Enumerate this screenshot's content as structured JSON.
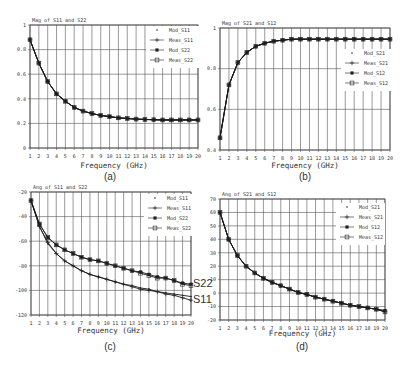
{
  "chart_data": [
    {
      "id": "a",
      "type": "line",
      "title": "Mag of S11 and S22",
      "caption": "(a)",
      "xlabel": "Frequency (GHz)",
      "ylabel": "",
      "x": [
        1,
        2,
        3,
        4,
        5,
        6,
        7,
        8,
        9,
        10,
        11,
        12,
        13,
        14,
        15,
        16,
        17,
        18,
        19,
        20
      ],
      "xlim": [
        1,
        20
      ],
      "ylim": [
        0,
        1
      ],
      "yticks": [
        "0",
        "0.2",
        "0.4",
        "0.6",
        "0.8",
        "1"
      ],
      "grid": true,
      "legend_position": "upper right",
      "legend": [
        "Mod_S11",
        "Meas_S11",
        "Mod_S22",
        "Meas_S22"
      ],
      "series": [
        {
          "name": "Mod_S11",
          "values": [
            0.88,
            0.69,
            0.54,
            0.44,
            0.38,
            0.33,
            0.3,
            0.28,
            0.265,
            0.255,
            0.245,
            0.24,
            0.235,
            0.232,
            0.23,
            0.228,
            0.228,
            0.228,
            0.228,
            0.228
          ]
        },
        {
          "name": "Meas_S11",
          "values": [
            0.88,
            0.69,
            0.54,
            0.44,
            0.38,
            0.33,
            0.3,
            0.28,
            0.265,
            0.255,
            0.245,
            0.24,
            0.235,
            0.232,
            0.23,
            0.228,
            0.228,
            0.228,
            0.228,
            0.228
          ]
        },
        {
          "name": "Mod_S22",
          "values": [
            0.88,
            0.69,
            0.54,
            0.44,
            0.38,
            0.33,
            0.3,
            0.28,
            0.265,
            0.255,
            0.245,
            0.24,
            0.235,
            0.232,
            0.23,
            0.228,
            0.228,
            0.228,
            0.228,
            0.228
          ]
        },
        {
          "name": "Meas_S22",
          "values": [
            0.88,
            0.69,
            0.54,
            0.44,
            0.38,
            0.33,
            0.3,
            0.28,
            0.265,
            0.255,
            0.245,
            0.24,
            0.235,
            0.232,
            0.23,
            0.228,
            0.228,
            0.228,
            0.228,
            0.228
          ]
        }
      ]
    },
    {
      "id": "b",
      "type": "line",
      "title": "Mag of S21 and S12",
      "caption": "(b)",
      "xlabel": "Frequency (GHz)",
      "ylabel": "",
      "x": [
        1,
        2,
        3,
        4,
        5,
        6,
        7,
        8,
        9,
        10,
        11,
        12,
        13,
        14,
        15,
        16,
        17,
        18,
        19,
        20
      ],
      "xlim": [
        1,
        20
      ],
      "ylim": [
        0.4,
        1
      ],
      "yticks": [
        "0.4",
        "0.6",
        "0.8",
        "1"
      ],
      "grid": true,
      "legend_position": "center right",
      "legend": [
        "Mod_S21",
        "Meas_S21",
        "Mod_S12",
        "Meas_S12"
      ],
      "series": [
        {
          "name": "Mod_S21",
          "values": [
            0.46,
            0.72,
            0.83,
            0.88,
            0.91,
            0.925,
            0.935,
            0.94,
            0.945,
            0.945,
            0.945,
            0.945,
            0.945,
            0.945,
            0.945,
            0.945,
            0.945,
            0.945,
            0.945,
            0.945
          ]
        },
        {
          "name": "Meas_S21",
          "values": [
            0.46,
            0.72,
            0.83,
            0.88,
            0.91,
            0.925,
            0.935,
            0.94,
            0.945,
            0.945,
            0.945,
            0.945,
            0.945,
            0.945,
            0.945,
            0.945,
            0.945,
            0.945,
            0.945,
            0.945
          ]
        },
        {
          "name": "Mod_S12",
          "values": [
            0.46,
            0.72,
            0.83,
            0.88,
            0.91,
            0.925,
            0.935,
            0.94,
            0.945,
            0.945,
            0.945,
            0.945,
            0.945,
            0.945,
            0.945,
            0.945,
            0.945,
            0.945,
            0.945,
            0.945
          ]
        },
        {
          "name": "Meas_S12",
          "values": [
            0.46,
            0.72,
            0.83,
            0.88,
            0.91,
            0.925,
            0.935,
            0.94,
            0.945,
            0.945,
            0.945,
            0.945,
            0.945,
            0.945,
            0.945,
            0.945,
            0.945,
            0.945,
            0.945,
            0.945
          ]
        }
      ]
    },
    {
      "id": "c",
      "type": "line",
      "title": "Ang of S11 and S22",
      "caption": "(c)",
      "xlabel": "Frequency (GHz)",
      "ylabel": "",
      "x": [
        1,
        2,
        3,
        4,
        5,
        6,
        7,
        8,
        9,
        10,
        11,
        12,
        13,
        14,
        15,
        16,
        17,
        18,
        19,
        20
      ],
      "xlim": [
        1,
        20
      ],
      "ylim": [
        -120,
        -20
      ],
      "yticks": [
        "-120",
        "-100",
        "-80",
        "-60",
        "-40",
        "-20"
      ],
      "grid": true,
      "legend_position": "upper right",
      "legend": [
        "Mod_S11",
        "Meas_S11",
        "Mod_S22",
        "Meas_S22"
      ],
      "annotations": [
        "S22",
        "S11"
      ],
      "series": [
        {
          "name": "Mod_S11",
          "values": [
            -27,
            -48,
            -62,
            -70,
            -76,
            -80,
            -84,
            -87,
            -89,
            -91,
            -93,
            -95,
            -96,
            -98,
            -99,
            -101,
            -102,
            -103,
            -104,
            -105
          ]
        },
        {
          "name": "Meas_S11",
          "values": [
            -27,
            -48,
            -61,
            -70,
            -76,
            -80,
            -84,
            -87,
            -89,
            -91,
            -93,
            -95,
            -97,
            -99,
            -100,
            -101,
            -103,
            -104,
            -106,
            -108
          ]
        },
        {
          "name": "Mod_S22",
          "values": [
            -27,
            -46,
            -57,
            -63,
            -67,
            -70,
            -73,
            -75,
            -76,
            -78,
            -80,
            -82,
            -84,
            -85,
            -87,
            -89,
            -90,
            -92,
            -94,
            -95
          ]
        },
        {
          "name": "Meas_S22",
          "values": [
            -27,
            -46,
            -57,
            -63,
            -67,
            -70,
            -73,
            -75,
            -76,
            -78,
            -80,
            -82,
            -84,
            -86,
            -88,
            -90,
            -90,
            -92,
            -95,
            -96
          ]
        }
      ]
    },
    {
      "id": "d",
      "type": "line",
      "title": "Ang of S21 and S12",
      "caption": "(d)",
      "xlabel": "Frequency (GHz)",
      "ylabel": "",
      "x": [
        1,
        2,
        3,
        4,
        5,
        6,
        7,
        8,
        9,
        10,
        11,
        12,
        13,
        14,
        15,
        16,
        17,
        18,
        19,
        20
      ],
      "xlim": [
        1,
        20
      ],
      "ylim": [
        -20,
        70
      ],
      "yticks": [
        "-20",
        "-10",
        "0",
        "10",
        "20",
        "30",
        "40",
        "50",
        "60",
        "70"
      ],
      "grid": true,
      "legend_position": "upper right",
      "legend": [
        "Mod_S21",
        "Meas_S21",
        "Mod_S12",
        "Meas_S12"
      ],
      "series": [
        {
          "name": "Mod_S21",
          "values": [
            60,
            40,
            28,
            20,
            15,
            11,
            8,
            5.5,
            3,
            0.5,
            -1,
            -3,
            -4.5,
            -6,
            -7.5,
            -9,
            -10,
            -11,
            -12,
            -13
          ]
        },
        {
          "name": "Meas_S21",
          "values": [
            60,
            40,
            28,
            20,
            15,
            11,
            8,
            5.5,
            3,
            0.5,
            -1,
            -3,
            -4.5,
            -6,
            -7.5,
            -9,
            -10,
            -11,
            -12,
            -14
          ]
        },
        {
          "name": "Mod_S12",
          "values": [
            60,
            40,
            28,
            20,
            15,
            11,
            8,
            5.5,
            3,
            0.5,
            -1,
            -3,
            -4.5,
            -6,
            -7.5,
            -9,
            -10,
            -11,
            -12,
            -13
          ]
        },
        {
          "name": "Meas_S12",
          "values": [
            60,
            40,
            28,
            20,
            15,
            11,
            8,
            5.5,
            3,
            0.5,
            -1,
            -3,
            -4.5,
            -6,
            -7.5,
            -9,
            -10,
            -11,
            -12,
            -14
          ]
        }
      ]
    }
  ]
}
